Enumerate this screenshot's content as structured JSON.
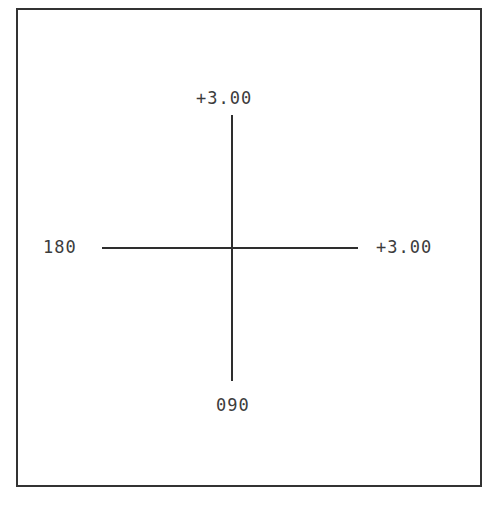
{
  "diagram": {
    "type": "axis-cross",
    "labels": {
      "top": "+3.00",
      "left": "180",
      "right": "+3.00",
      "bottom": "090"
    },
    "colors": {
      "line": "#2e2e2e",
      "border": "#333333",
      "text": "#3c3c3c",
      "background": "#ffffff"
    }
  }
}
